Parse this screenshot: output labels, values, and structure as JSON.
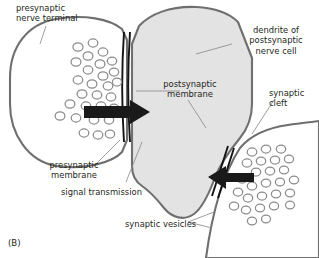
{
  "figure": {
    "panel_id": "(B)",
    "labels": {
      "presynaptic_nerve_terminal": "presynaptic\nnerve terminal",
      "dendrite_of_postsynaptic_nerve_cell": "dendrite of\npostsynaptic\nnerve cell",
      "postsynaptic_membrane": "postsynaptic\nmembrane",
      "synaptic_cleft": "synaptic\ncleft",
      "presynaptic_membrane": "presynaptic\nmembrane",
      "signal_transmission": "signal transmission",
      "synaptic_vesicles": "synaptic vesicles"
    }
  },
  "colors": {
    "background": "#ffffff",
    "text": "#231f20",
    "membrane_outline": "#7d7d7d",
    "dendrite_fill": "#e3e3e3",
    "terminal_fill": "#ffffff",
    "vesicle_stroke": "#8c8c8c",
    "cleft_line": "#111111",
    "arrow_fill": "#1a1a1a",
    "leader_line": "#8c8c8c"
  },
  "structures": {
    "presynaptic_terminal": {
      "name": "presynaptic nerve terminal",
      "fill": "#ffffff",
      "position": "left"
    },
    "postsynaptic_dendrite": {
      "name": "dendrite of postsynaptic nerve cell",
      "fill": "#e3e3e3",
      "position": "center-right"
    },
    "second_terminal": {
      "name": "second presynaptic terminal",
      "fill": "#ffffff",
      "position": "bottom-right"
    },
    "vesicle_clusters": [
      {
        "name": "upper-left vesicle cluster",
        "count": 27
      },
      {
        "name": "lower-right vesicle cluster",
        "count": 25
      }
    ],
    "arrows": [
      {
        "name": "signal transmission arrow left",
        "direction": "right"
      },
      {
        "name": "signal transmission arrow right",
        "direction": "left"
      }
    ]
  }
}
